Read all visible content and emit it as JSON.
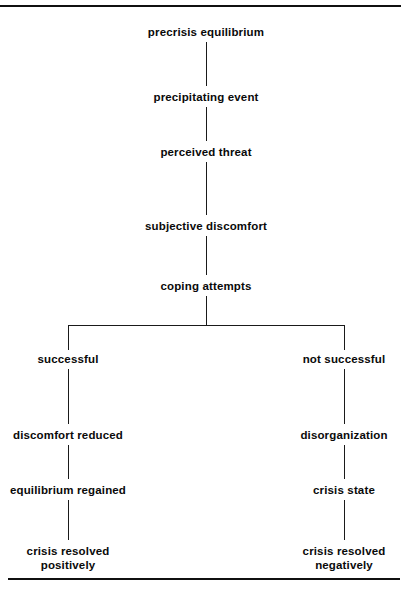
{
  "diagram": {
    "type": "flowchart",
    "orientation": "top-down",
    "line_color": "#101010",
    "text_color": "#0a0a0a",
    "background": "#ffffff",
    "top_rule": "horizontal rule",
    "bottom_rule": "horizontal rule",
    "nodes": [
      {
        "id": "precrisis-equilibrium",
        "label": "precrisis equilibrium",
        "column": "center"
      },
      {
        "id": "precipitating-event",
        "label": "precipitating event",
        "column": "center"
      },
      {
        "id": "perceived-threat",
        "label": "perceived threat",
        "column": "center"
      },
      {
        "id": "subjective-discomfort",
        "label": "subjective discomfort",
        "column": "center"
      },
      {
        "id": "coping-attempts",
        "label": "coping attempts",
        "column": "center"
      },
      {
        "id": "successful",
        "label": "successful",
        "column": "left"
      },
      {
        "id": "not-successful",
        "label": "not successful",
        "column": "right"
      },
      {
        "id": "discomfort-reduced",
        "label": "discomfort reduced",
        "column": "left"
      },
      {
        "id": "disorganization",
        "label": "disorganization",
        "column": "right"
      },
      {
        "id": "equilibrium-regained",
        "label": "equilibrium regained",
        "column": "left"
      },
      {
        "id": "crisis-state",
        "label": "crisis state",
        "column": "right"
      },
      {
        "id": "crisis-resolved-positively-line1",
        "label": "crisis resolved",
        "column": "left"
      },
      {
        "id": "crisis-resolved-positively-line2",
        "label": "positively",
        "column": "left"
      },
      {
        "id": "crisis-resolved-negatively-line1",
        "label": "crisis resolved",
        "column": "right"
      },
      {
        "id": "crisis-resolved-negatively-line2",
        "label": "negatively",
        "column": "right"
      }
    ],
    "edges": [
      {
        "from": "precrisis-equilibrium",
        "to": "precipitating-event"
      },
      {
        "from": "precipitating-event",
        "to": "perceived-threat"
      },
      {
        "from": "perceived-threat",
        "to": "subjective-discomfort"
      },
      {
        "from": "subjective-discomfort",
        "to": "coping-attempts"
      },
      {
        "from": "coping-attempts",
        "to": "successful"
      },
      {
        "from": "coping-attempts",
        "to": "not-successful"
      },
      {
        "from": "successful",
        "to": "discomfort-reduced"
      },
      {
        "from": "discomfort-reduced",
        "to": "equilibrium-regained"
      },
      {
        "from": "equilibrium-regained",
        "to": "crisis-resolved-positively-line1"
      },
      {
        "from": "not-successful",
        "to": "disorganization"
      },
      {
        "from": "disorganization",
        "to": "crisis-state"
      },
      {
        "from": "crisis-state",
        "to": "crisis-resolved-negatively-line1"
      }
    ]
  }
}
